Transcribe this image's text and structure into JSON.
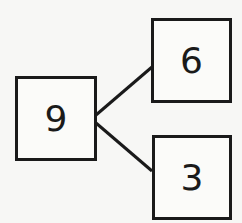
{
  "number_bond": {
    "whole": "9",
    "parts": [
      "6",
      "3"
    ]
  },
  "colors": {
    "stroke": "#1a1a1a",
    "background": "#f7f7f5"
  }
}
